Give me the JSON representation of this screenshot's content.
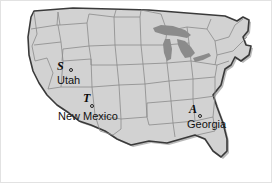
{
  "image": {
    "title": "United States map with three marked sites",
    "width": 272,
    "height": 183,
    "background_color": "#ffffff"
  },
  "map": {
    "name": "united-states-map",
    "land_fill": "#d2d2d2",
    "state_border_color": "#8a8a8a",
    "coast_outline_color": "#3a3a3a",
    "lakes_fill": "#8b8b8b",
    "shadow_color": "#b4b4b4"
  },
  "sites": [
    {
      "code": "S",
      "place": "Utah",
      "code_x": 56,
      "code_y": 59,
      "dot_x": 68,
      "dot_y": 67,
      "label_x": 56,
      "label_y": 79
    },
    {
      "code": "T",
      "place": "New Mexico",
      "code_x": 82,
      "code_y": 91,
      "dot_x": 89,
      "dot_y": 103,
      "label_x": 57,
      "label_y": 113
    },
    {
      "code": "A",
      "place": "Georgia",
      "code_x": 188,
      "code_y": 102,
      "dot_x": 197,
      "dot_y": 113,
      "label_x": 186,
      "label_y": 119
    }
  ]
}
